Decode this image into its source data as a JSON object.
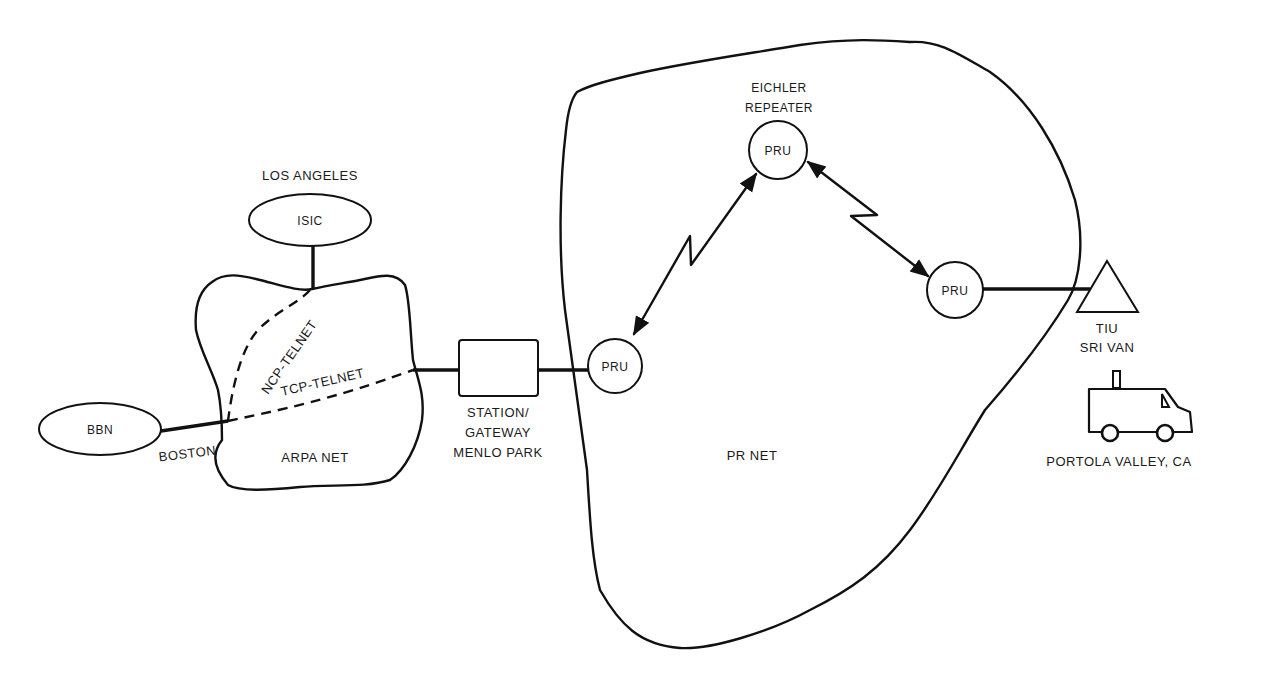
{
  "diagram": {
    "networks": {
      "arpanet": {
        "label": "ARPA NET"
      },
      "prnet": {
        "label": "PR NET"
      }
    },
    "nodes": {
      "isic": {
        "label": "ISIC",
        "location": "LOS ANGELES"
      },
      "bbn": {
        "label": "BBN",
        "location": "BOSTON"
      },
      "gateway": {
        "line1": "STATION/",
        "line2": "GATEWAY",
        "line3": "MENLO PARK"
      },
      "pru_left": {
        "label": "PRU"
      },
      "pru_top": {
        "label": "PRU",
        "caption1": "EICHLER",
        "caption2": "REPEATER"
      },
      "pru_right": {
        "label": "PRU"
      },
      "tiu": {
        "line1": "TIU",
        "line2": "SRI VAN"
      },
      "van": {
        "location": "PORTOLA VALLEY, CA"
      }
    },
    "paths": {
      "ncp": {
        "label": "NCP-TELNET"
      },
      "tcp": {
        "label": "TCP-TELNET"
      }
    }
  }
}
